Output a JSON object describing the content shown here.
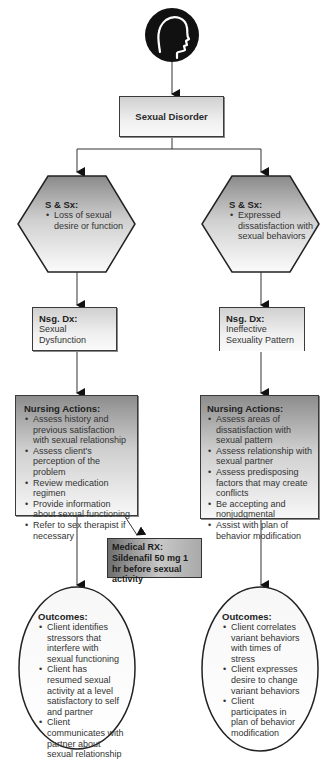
{
  "root": {
    "icon": "head-profile-icon",
    "label": "Sexual Disorder"
  },
  "left": {
    "signs": {
      "title": "S & Sx:",
      "items": [
        "Loss of sexual desire or function"
      ]
    },
    "diagnosis": {
      "title": "Nsg. Dx:",
      "text": "Sexual Dysfunction"
    },
    "nursing_actions": {
      "title": "Nursing Actions:",
      "items": [
        "Assess history and previous satisfaction with sexual relationship",
        "Assess client's perception of the problem",
        "Review medication regimen",
        "Provide information about sexual functioning",
        "Refer to sex therapist if necessary"
      ]
    },
    "medical_rx": {
      "title": "Medical RX:",
      "text": "Sildenafil 50 mg 1 hr before sexual activity"
    },
    "outcomes": {
      "title": "Outcomes:",
      "items": [
        "Client identifies stressors that interfere with sexual functioning",
        "Client has resumed sexual activity at a level satisfactory to self and partner",
        "Client communicates with partner about sexual relationship"
      ]
    }
  },
  "right": {
    "signs": {
      "title": "S & Sx:",
      "items": [
        "Expressed dissatisfaction with sexual behaviors"
      ]
    },
    "diagnosis": {
      "title": "Nsg. Dx:",
      "text": "Ineffective Sexuality Pattern"
    },
    "nursing_actions": {
      "title": "Nursing Actions:",
      "items": [
        "Assess areas of dissatisfaction with sexual pattern",
        "Assess relationship with sexual partner",
        "Assess predisposing factors that may create conflicts",
        "Be accepting and nonjudgmental",
        "Assist with plan of behavior modification"
      ]
    },
    "outcomes": {
      "title": "Outcomes:",
      "items": [
        "Client correlates variant behaviors with times of stress",
        "Client expresses desire to change variant behaviors",
        "Client participates in plan of behavior modification"
      ]
    }
  },
  "colors": {
    "line": "#333333",
    "icon_fill": "#111111"
  }
}
